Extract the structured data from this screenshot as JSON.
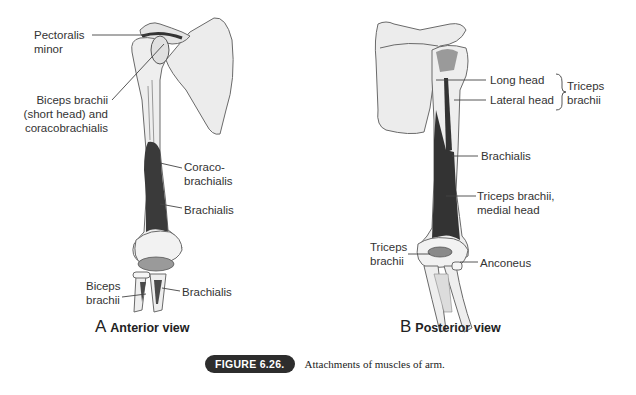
{
  "figure": {
    "number_label": "FIGURE 6.26.",
    "caption": "Attachments of muscles of arm."
  },
  "panels": [
    {
      "id": "A",
      "letter": "A",
      "title": "Anterior view",
      "labels": [
        {
          "id": "pectoralis-minor",
          "lines": [
            "Pectoralis",
            "minor"
          ]
        },
        {
          "id": "biceps-short-coraco",
          "lines": [
            "Biceps brachii",
            "(short head) and",
            "coracobrachialis"
          ]
        },
        {
          "id": "coracobrachialis",
          "lines": [
            "Coraco-",
            "brachialis"
          ]
        },
        {
          "id": "brachialis-upper",
          "lines": [
            "Brachialis"
          ]
        },
        {
          "id": "biceps-brachii",
          "lines": [
            "Biceps",
            "brachii"
          ]
        },
        {
          "id": "brachialis-lower",
          "lines": [
            "Brachialis"
          ]
        }
      ]
    },
    {
      "id": "B",
      "letter": "B",
      "title": "Posterior view",
      "labels": [
        {
          "id": "long-head",
          "lines": [
            "Long head"
          ]
        },
        {
          "id": "lateral-head",
          "lines": [
            "Lateral head"
          ]
        },
        {
          "id": "triceps-group",
          "lines": [
            "Triceps",
            "brachii"
          ]
        },
        {
          "id": "brachialis",
          "lines": [
            "Brachialis"
          ]
        },
        {
          "id": "triceps-medial",
          "lines": [
            "Triceps brachii,",
            "medial head"
          ]
        },
        {
          "id": "triceps-brachii",
          "lines": [
            "Triceps",
            "brachii"
          ]
        },
        {
          "id": "anconeus",
          "lines": [
            "Anconeus"
          ]
        }
      ]
    }
  ],
  "colors": {
    "bone_fill": "#eeeeee",
    "bone_stroke": "#6a6a6a",
    "muscle_dark": "#3a3a3a",
    "muscle_mid": "#8a8a8a",
    "leader_line": "#444444",
    "badge_bg": "#2d2d2d"
  }
}
